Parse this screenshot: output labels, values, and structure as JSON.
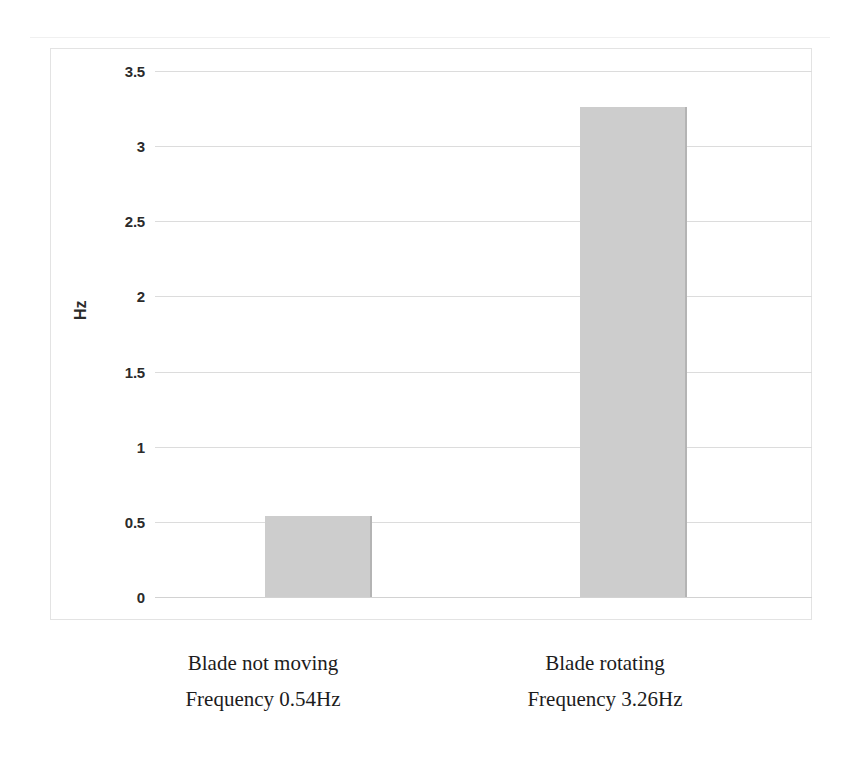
{
  "chart_data": {
    "type": "bar",
    "title": "",
    "subtitle": "",
    "xlabel": "",
    "ylabel": "Hz",
    "categories": [
      "Blade not moving",
      "Blade rotating"
    ],
    "category_sublabels": [
      "Frequency 0.54Hz",
      "Frequency 3.26Hz"
    ],
    "values": [
      0.54,
      3.26
    ],
    "ylim": [
      0,
      3.5
    ],
    "ytick_values": [
      0,
      0.5,
      1,
      1.5,
      2,
      2.5,
      3,
      3.5
    ],
    "ytick_labels": [
      "0",
      "0.5",
      "1",
      "1.5",
      "2",
      "2.5",
      "3",
      "3.5"
    ],
    "grid": true,
    "legend": false,
    "legend_position": "none",
    "units": "Hz",
    "bar_color": "#cdcdcd",
    "bar_edge_color": "#b4b4b4",
    "gridline_color": "#dcdcdc",
    "axis_text_color": "#2b2b2b",
    "plot_border_color": "#e3e3e3",
    "background_color": "#ffffff"
  },
  "scan_artifacts": {
    "top_left": "",
    "top_right_1": "",
    "top_right_2": ""
  }
}
